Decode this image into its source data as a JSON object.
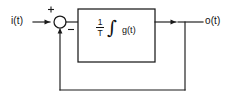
{
  "diagram": {
    "type": "block-diagram",
    "background_color": "#ffffff",
    "line_color": "#1a1a1a",
    "input": {
      "label": "i(t)",
      "name": "input-signal-label"
    },
    "output": {
      "label": "o(t)",
      "name": "output-signal-label"
    },
    "summing_junction": {
      "name": "summing-junction",
      "shape": "circle",
      "center_x": 60,
      "center_y": 22,
      "radius": 6,
      "plus_sign": "+",
      "minus_sign": "−",
      "plus_position": "top-left",
      "minus_position": "bottom-right"
    },
    "block": {
      "name": "integrator-block",
      "x": 78,
      "y": 9,
      "width": 77,
      "height": 53,
      "formula": {
        "fraction_numerator": "1",
        "fraction_denominator": "T",
        "integral_symbol": "∫",
        "integrand": "g(t)",
        "plain_text": "1/T ∫ g(t)"
      }
    },
    "wires": [
      {
        "name": "input-wire",
        "from": "i(t)",
        "to": "summing-junction",
        "arrow": true
      },
      {
        "name": "error-wire",
        "from": "summing-junction",
        "to": "integrator-block",
        "arrow": false
      },
      {
        "name": "block-output-wire",
        "from": "integrator-block",
        "to": "output-tap",
        "arrow": true
      },
      {
        "name": "output-wire",
        "from": "output-tap",
        "to": "o(t)",
        "arrow": false
      },
      {
        "name": "feedback-wire",
        "from": "output-tap",
        "to": "summing-junction",
        "arrow": true
      }
    ],
    "feedback_path": {
      "name": "feedback-path",
      "tap_x": 185,
      "bottom_y": 90,
      "return_x": 60,
      "sign": "negative"
    }
  }
}
